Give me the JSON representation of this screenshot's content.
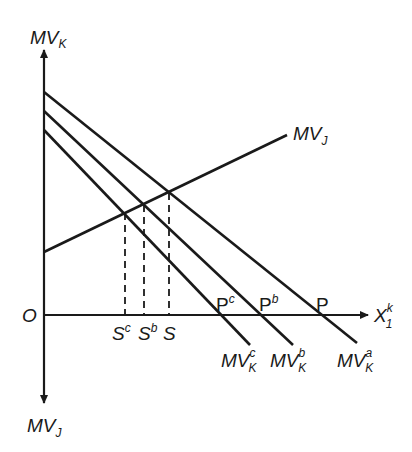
{
  "diagram": {
    "axes": {
      "y_up_label": {
        "main": "MV",
        "sub": "K"
      },
      "y_down_label": {
        "main": "MV",
        "sub": "J"
      },
      "x_label": {
        "main": "X",
        "sub": "1",
        "sup": "k"
      },
      "origin_label": "O"
    },
    "lines": {
      "mvj": {
        "main": "MV",
        "sub": "J"
      },
      "mvk_a": {
        "main": "MV",
        "sub": "K",
        "sup": "a"
      },
      "mvk_b": {
        "main": "MV",
        "sub": "K",
        "sup": "b"
      },
      "mvk_c": {
        "main": "MV",
        "sub": "K",
        "sup": "c"
      }
    },
    "points": {
      "p": {
        "main": "P",
        "sup": ""
      },
      "pb": {
        "main": "P",
        "sup": "b"
      },
      "pc": {
        "main": "P",
        "sup": "c"
      },
      "s": {
        "main": "S",
        "sup": ""
      },
      "sb": {
        "main": "S",
        "sup": "b"
      },
      "sc": {
        "main": "S",
        "sup": "c"
      }
    },
    "colors": {
      "ink": "#1a1a1a",
      "background": "#ffffff"
    }
  }
}
